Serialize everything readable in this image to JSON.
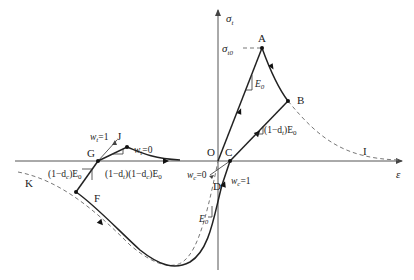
{
  "figure": {
    "axes": {
      "y_label": "σ",
      "y_sub": "t",
      "x_label": "ε",
      "origin_label": "O",
      "peak_stress_label": "σ",
      "peak_stress_sub": "t0"
    },
    "points": {
      "A": "A",
      "B": "B",
      "C": "C",
      "D": "D",
      "F": "F",
      "G": "G",
      "I": "I",
      "J": "J",
      "K": "K"
    },
    "slopes": {
      "E0_upper": {
        "main": "E",
        "sub": "0"
      },
      "tension_unload": {
        "pre": "(1−d",
        "sub1": "t",
        "post": ")E",
        "sub2": "0"
      },
      "E0_lower": {
        "main": "E",
        "sub": "0"
      },
      "compression_unload": {
        "pre": "(1−d",
        "sub1": "c",
        "post": ")E",
        "sub2": "0"
      },
      "combined": {
        "p1": "(1−d",
        "s1": "t",
        "p2": ")(1−d",
        "s2": "c",
        "p3": ")E",
        "s3": "0"
      }
    },
    "weights": {
      "wt1": {
        "w": "w",
        "sub": "t",
        "val": "=1"
      },
      "wt0": {
        "w": "w",
        "sub": "t",
        "val": "=0"
      },
      "wc0": {
        "w": "w",
        "sub": "c",
        "val": "=0"
      },
      "wc1": {
        "w": "w",
        "sub": "c",
        "val": "=1"
      }
    }
  }
}
